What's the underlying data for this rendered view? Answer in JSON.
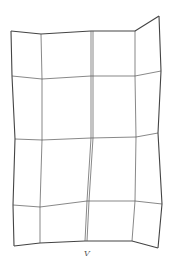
{
  "diagram": {
    "type": "deformed-grid-mesh",
    "label": "V",
    "stroke_color": "#555555",
    "outer_stroke_color": "#444444",
    "grid": {
      "rows": [
        [
          [
            11,
            31
          ],
          [
            41,
            34
          ],
          [
            91,
            31
          ],
          [
            135,
            31
          ],
          [
            159,
            16
          ]
        ],
        [
          [
            12,
            76
          ],
          [
            42,
            79
          ],
          [
            91,
            76
          ],
          [
            135,
            76
          ],
          [
            161,
            71
          ]
        ],
        [
          [
            15,
            139
          ],
          [
            42,
            140
          ],
          [
            91,
            138
          ],
          [
            136,
            137
          ],
          [
            158,
            133
          ]
        ],
        [
          [
            13,
            205
          ],
          [
            40,
            207
          ],
          [
            87,
            201
          ],
          [
            135,
            201
          ],
          [
            162,
            204
          ]
        ],
        [
          [
            14,
            246
          ],
          [
            40,
            243
          ],
          [
            85,
            241
          ],
          [
            132,
            241
          ],
          [
            158,
            248
          ]
        ]
      ],
      "double_column_index": 2
    }
  }
}
